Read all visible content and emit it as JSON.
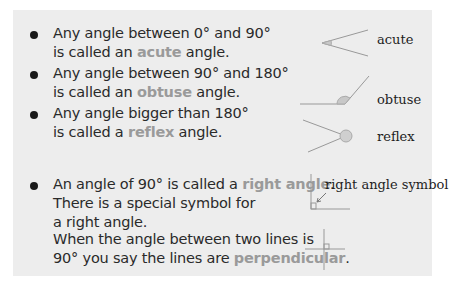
{
  "bullets": [
    {
      "line1": "Any angle between 0° and 90°",
      "line2_pre": "is called an ",
      "term": "acute",
      "line2_post": " angle."
    },
    {
      "line1": "Any angle between 90° and 180°",
      "line2_pre": "is called an ",
      "term": "obtuse",
      "line2_post": " angle."
    },
    {
      "line1": "Any angle bigger than 180°",
      "line2_pre": "is called a ",
      "term": "reflex",
      "line2_post": " angle."
    },
    {
      "line1_pre": "An angle of 90° is called a ",
      "term": "right angle",
      "line1_post": ".",
      "line2": "There is a special symbol for",
      "line3": "a right angle."
    }
  ],
  "perpendicular": {
    "line1": "When the angle between two lines is",
    "line2_pre": "90° you say the lines are ",
    "term": "perpendicular",
    "line2_post": "."
  },
  "labels": {
    "acute": "acute",
    "obtuse": "obtuse",
    "reflex": "reflex",
    "right_angle_symbol": "right angle symbol"
  },
  "colors": {
    "panel": "#ededed",
    "highlight": "#9a9a9a",
    "line": "#999999"
  }
}
